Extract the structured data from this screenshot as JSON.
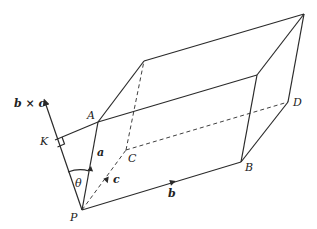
{
  "diagram": {
    "points": {
      "P": {
        "label": "P",
        "x": 82,
        "y": 210
      },
      "A": {
        "label": "A",
        "x": 98,
        "y": 122
      },
      "B": {
        "label": "B",
        "x": 241,
        "y": 162
      },
      "C": {
        "label": "C",
        "x": 126,
        "y": 150
      },
      "D": {
        "label": "D",
        "x": 288,
        "y": 102
      },
      "K": {
        "label": "K",
        "x": 55,
        "y": 140
      },
      "E": {
        "label": "",
        "x": 144,
        "y": 61
      },
      "F": {
        "label": "",
        "x": 257,
        "y": 75
      },
      "G": {
        "label": "",
        "x": 304,
        "y": 14
      }
    },
    "vector_labels": {
      "a": "a",
      "b": "b",
      "c": "c",
      "bxc": "b × c"
    },
    "angle_label": "θ"
  }
}
